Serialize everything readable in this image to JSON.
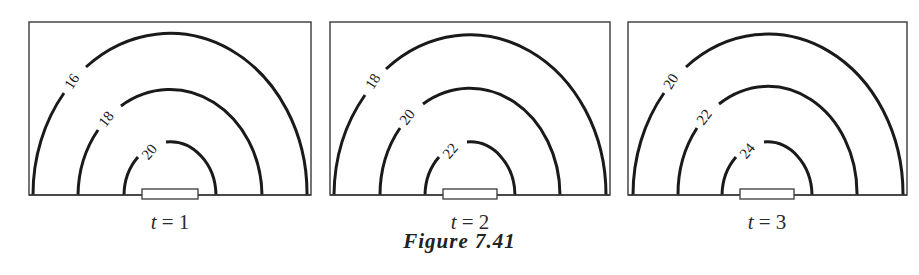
{
  "figure": {
    "caption": "Figure 7.41",
    "panels": [
      {
        "time_label_var": "t",
        "time_label_rest": " = 1",
        "contours": [
          {
            "level": "16",
            "ring": "outer"
          },
          {
            "level": "18",
            "ring": "middle"
          },
          {
            "level": "20",
            "ring": "inner"
          }
        ]
      },
      {
        "time_label_var": "t",
        "time_label_rest": " = 2",
        "contours": [
          {
            "level": "18",
            "ring": "outer"
          },
          {
            "level": "20",
            "ring": "middle"
          },
          {
            "level": "22",
            "ring": "inner"
          }
        ]
      },
      {
        "time_label_var": "t",
        "time_label_rest": " = 3",
        "contours": [
          {
            "level": "20",
            "ring": "outer"
          },
          {
            "level": "22",
            "ring": "middle"
          },
          {
            "level": "24",
            "ring": "inner"
          }
        ]
      }
    ]
  },
  "colors": {
    "line": "#1a1a1a",
    "frame": "#3a3a3a",
    "background": "#ffffff"
  }
}
